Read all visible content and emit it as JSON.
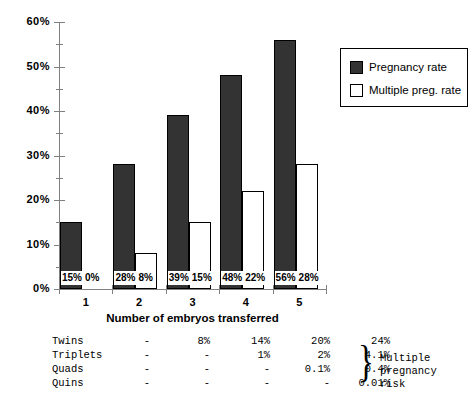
{
  "chart_data": {
    "type": "bar",
    "title": "",
    "xlabel": "Number of embryos transferred",
    "ylabel": "",
    "categories": [
      "1",
      "2",
      "3",
      "4",
      "5"
    ],
    "ylim": [
      0,
      60
    ],
    "y_tick_labels": [
      "0%",
      "10%",
      "20%",
      "30%",
      "40%",
      "50%",
      "60%"
    ],
    "y_tick_values": [
      0,
      10,
      20,
      30,
      40,
      50,
      60
    ],
    "y_minor_tick_values": [
      5,
      15,
      25,
      35,
      45,
      55
    ],
    "grid": false,
    "legend_position": "top-right",
    "series": [
      {
        "name": "Pregnancy rate",
        "color": "#333333",
        "values": [
          15,
          28,
          39,
          48,
          56
        ],
        "value_labels": [
          "15%",
          "28%",
          "39%",
          "48%",
          "56%"
        ]
      },
      {
        "name": "Multiple preg. rate",
        "color": "#ffffff",
        "values": [
          0,
          8,
          15,
          22,
          28
        ],
        "value_labels": [
          "0%",
          "8%",
          "15%",
          "22%",
          "28%"
        ]
      }
    ]
  },
  "legend": {
    "items": [
      {
        "label": "Pregnancy rate",
        "swatch": "dark"
      },
      {
        "label": "Multiple preg. rate",
        "swatch": "white"
      }
    ]
  },
  "table": {
    "row_labels": [
      "Twins",
      "Triplets",
      "Quads",
      "Quins"
    ],
    "rows": [
      [
        "-",
        "8%",
        "14%",
        "20%",
        "24%"
      ],
      [
        "-",
        "-",
        "1%",
        "2%",
        "4.1%"
      ],
      [
        "-",
        "-",
        "-",
        "0.1%",
        "0.4%"
      ],
      [
        "-",
        "-",
        "-",
        "-",
        "0.01%"
      ]
    ],
    "brace_glyph": "}",
    "note_line1": "Multiple pregnancy",
    "note_line2": "risk"
  }
}
